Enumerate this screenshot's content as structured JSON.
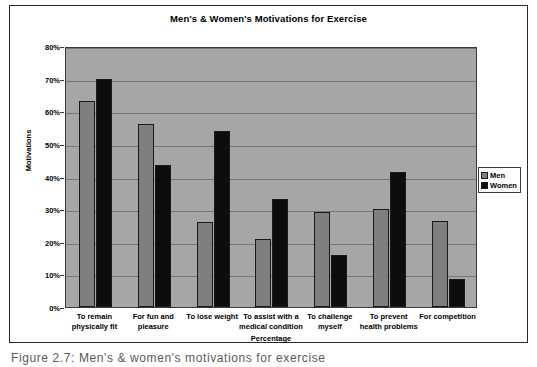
{
  "figure": {
    "caption": "Figure 2.7: Men's & women's motivations for exercise"
  },
  "legend": {
    "position": "right",
    "entries": [
      {
        "label": "Men",
        "color": "#7f7f7f"
      },
      {
        "label": "Women",
        "color": "#0d0d0d"
      }
    ]
  },
  "axes": {
    "y_title": "Motivations",
    "x_title": "Percentage",
    "y_ticks": [
      "0%",
      "10%",
      "20%",
      "30%",
      "40%",
      "50%",
      "60%",
      "70%",
      "80%"
    ]
  },
  "chart_data": {
    "type": "bar",
    "title": "Men's & Women's Motivations for Exercise",
    "xlabel": "Percentage",
    "ylabel": "Motivations",
    "ylim": [
      0,
      80
    ],
    "ytick_step": 10,
    "ytick_suffix": "%",
    "grid": true,
    "legend_position": "right",
    "plot_background": "#a6a6a6",
    "categories": [
      "To remain physically fit",
      "For fun and pleasure",
      "To lose weight",
      "To assist with a medical condition",
      "To challenge myself",
      "To prevent health problems",
      "For competition"
    ],
    "category_lines": [
      [
        "To remain",
        "physically fit"
      ],
      [
        "For fun and",
        "pleasure"
      ],
      [
        "To lose weight"
      ],
      [
        "To assist with a",
        "medical condition"
      ],
      [
        "To challenge",
        "myself"
      ],
      [
        "To prevent",
        "health problems"
      ],
      [
        "For competition"
      ]
    ],
    "series": [
      {
        "name": "Men",
        "color": "#7f7f7f",
        "values": [
          63,
          56,
          26,
          21,
          29,
          30,
          26.5
        ]
      },
      {
        "name": "Women",
        "color": "#0d0d0d",
        "values": [
          70,
          43.5,
          54,
          33,
          16,
          41.5,
          8.5
        ]
      }
    ]
  }
}
